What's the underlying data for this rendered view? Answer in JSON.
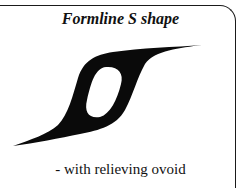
{
  "figure": {
    "title": "Formline S shape",
    "caption": "-  with relieving ovoid",
    "shape_icon": "formline-s-shape",
    "colors": {
      "shape": "#0a0a0a",
      "background": "#ffffff",
      "border": "#1a1a1a"
    }
  }
}
